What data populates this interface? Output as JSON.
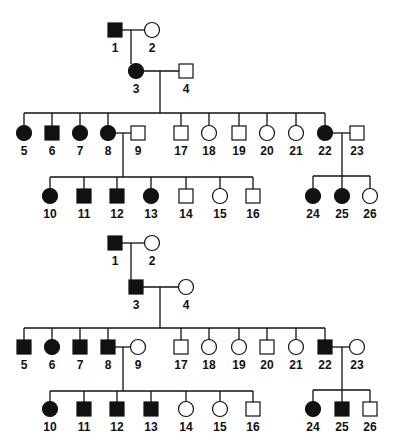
{
  "pedigrees": [
    {
      "name": "pedigree-top",
      "individuals": [
        {
          "id": "1",
          "sex": "male",
          "affected": true,
          "x": 115,
          "y": 30
        },
        {
          "id": "2",
          "sex": "female",
          "affected": false,
          "x": 152,
          "y": 30
        },
        {
          "id": "3",
          "sex": "female",
          "affected": true,
          "x": 136,
          "y": 71
        },
        {
          "id": "4",
          "sex": "male",
          "affected": false,
          "x": 186,
          "y": 71
        },
        {
          "id": "5",
          "sex": "female",
          "affected": true,
          "x": 24,
          "y": 133
        },
        {
          "id": "6",
          "sex": "male",
          "affected": true,
          "x": 52,
          "y": 133
        },
        {
          "id": "7",
          "sex": "female",
          "affected": true,
          "x": 80,
          "y": 133
        },
        {
          "id": "8",
          "sex": "female",
          "affected": true,
          "x": 108,
          "y": 133
        },
        {
          "id": "9",
          "sex": "male",
          "affected": false,
          "x": 138,
          "y": 133
        },
        {
          "id": "17",
          "sex": "male",
          "affected": false,
          "x": 181,
          "y": 133
        },
        {
          "id": "18",
          "sex": "female",
          "affected": false,
          "x": 209,
          "y": 133
        },
        {
          "id": "19",
          "sex": "male",
          "affected": false,
          "x": 239,
          "y": 133
        },
        {
          "id": "20",
          "sex": "female",
          "affected": false,
          "x": 267,
          "y": 133
        },
        {
          "id": "21",
          "sex": "female",
          "affected": false,
          "x": 296,
          "y": 133
        },
        {
          "id": "22",
          "sex": "female",
          "affected": true,
          "x": 325,
          "y": 133
        },
        {
          "id": "23",
          "sex": "male",
          "affected": false,
          "x": 357,
          "y": 133
        },
        {
          "id": "10",
          "sex": "female",
          "affected": true,
          "x": 50,
          "y": 196
        },
        {
          "id": "11",
          "sex": "male",
          "affected": true,
          "x": 84,
          "y": 196
        },
        {
          "id": "12",
          "sex": "male",
          "affected": true,
          "x": 117,
          "y": 196
        },
        {
          "id": "13",
          "sex": "female",
          "affected": true,
          "x": 151,
          "y": 196
        },
        {
          "id": "14",
          "sex": "male",
          "affected": false,
          "x": 186,
          "y": 196
        },
        {
          "id": "15",
          "sex": "female",
          "affected": false,
          "x": 220,
          "y": 196
        },
        {
          "id": "16",
          "sex": "male",
          "affected": false,
          "x": 253,
          "y": 196
        },
        {
          "id": "24",
          "sex": "female",
          "affected": true,
          "x": 313,
          "y": 196
        },
        {
          "id": "25",
          "sex": "female",
          "affected": true,
          "x": 342,
          "y": 196
        },
        {
          "id": "26",
          "sex": "female",
          "affected": false,
          "x": 370,
          "y": 196
        }
      ],
      "lines": [
        [
          122,
          30,
          145,
          30
        ],
        [
          131,
          30,
          131,
          64
        ],
        [
          143,
          71,
          179,
          71
        ],
        [
          160,
          71,
          160,
          113
        ],
        [
          24,
          113,
          325,
          113
        ],
        [
          24,
          113,
          24,
          126
        ],
        [
          52,
          113,
          52,
          126
        ],
        [
          80,
          113,
          80,
          126
        ],
        [
          108,
          113,
          108,
          126
        ],
        [
          181,
          113,
          181,
          126
        ],
        [
          209,
          113,
          209,
          126
        ],
        [
          239,
          113,
          239,
          126
        ],
        [
          267,
          113,
          267,
          126
        ],
        [
          296,
          113,
          296,
          126
        ],
        [
          325,
          113,
          325,
          126
        ],
        [
          115,
          133,
          131,
          133
        ],
        [
          123,
          133,
          123,
          177
        ],
        [
          50,
          177,
          253,
          177
        ],
        [
          50,
          177,
          50,
          189
        ],
        [
          84,
          177,
          84,
          189
        ],
        [
          117,
          177,
          117,
          189
        ],
        [
          151,
          177,
          151,
          189
        ],
        [
          186,
          177,
          186,
          189
        ],
        [
          220,
          177,
          220,
          189
        ],
        [
          253,
          177,
          253,
          189
        ],
        [
          332,
          133,
          350,
          133
        ],
        [
          342,
          133,
          342,
          176
        ],
        [
          313,
          176,
          370,
          176
        ],
        [
          313,
          176,
          313,
          189
        ],
        [
          342,
          176,
          342,
          189
        ],
        [
          370,
          176,
          370,
          189
        ]
      ]
    },
    {
      "name": "pedigree-bottom",
      "individuals": [
        {
          "id": "1",
          "sex": "male",
          "affected": true,
          "x": 115,
          "y": 243
        },
        {
          "id": "2",
          "sex": "female",
          "affected": false,
          "x": 152,
          "y": 243
        },
        {
          "id": "3",
          "sex": "male",
          "affected": true,
          "x": 136,
          "y": 287
        },
        {
          "id": "4",
          "sex": "female",
          "affected": false,
          "x": 186,
          "y": 287
        },
        {
          "id": "5",
          "sex": "male",
          "affected": true,
          "x": 24,
          "y": 347
        },
        {
          "id": "6",
          "sex": "female",
          "affected": true,
          "x": 52,
          "y": 347
        },
        {
          "id": "7",
          "sex": "male",
          "affected": true,
          "x": 80,
          "y": 347
        },
        {
          "id": "8",
          "sex": "male",
          "affected": true,
          "x": 108,
          "y": 347
        },
        {
          "id": "9",
          "sex": "female",
          "affected": false,
          "x": 138,
          "y": 347
        },
        {
          "id": "17",
          "sex": "male",
          "affected": false,
          "x": 181,
          "y": 347
        },
        {
          "id": "18",
          "sex": "female",
          "affected": false,
          "x": 209,
          "y": 347
        },
        {
          "id": "19",
          "sex": "female",
          "affected": false,
          "x": 239,
          "y": 347
        },
        {
          "id": "20",
          "sex": "male",
          "affected": false,
          "x": 267,
          "y": 347
        },
        {
          "id": "21",
          "sex": "female",
          "affected": false,
          "x": 296,
          "y": 347
        },
        {
          "id": "22",
          "sex": "male",
          "affected": true,
          "x": 325,
          "y": 347
        },
        {
          "id": "23",
          "sex": "female",
          "affected": false,
          "x": 357,
          "y": 347
        },
        {
          "id": "10",
          "sex": "female",
          "affected": true,
          "x": 50,
          "y": 409
        },
        {
          "id": "11",
          "sex": "male",
          "affected": true,
          "x": 84,
          "y": 409
        },
        {
          "id": "12",
          "sex": "male",
          "affected": true,
          "x": 117,
          "y": 409
        },
        {
          "id": "13",
          "sex": "male",
          "affected": true,
          "x": 151,
          "y": 409
        },
        {
          "id": "14",
          "sex": "female",
          "affected": false,
          "x": 186,
          "y": 409
        },
        {
          "id": "15",
          "sex": "female",
          "affected": false,
          "x": 220,
          "y": 409
        },
        {
          "id": "16",
          "sex": "male",
          "affected": false,
          "x": 253,
          "y": 409
        },
        {
          "id": "24",
          "sex": "female",
          "affected": true,
          "x": 313,
          "y": 409
        },
        {
          "id": "25",
          "sex": "male",
          "affected": true,
          "x": 342,
          "y": 409
        },
        {
          "id": "26",
          "sex": "male",
          "affected": false,
          "x": 370,
          "y": 409
        }
      ],
      "lines": [
        [
          122,
          243,
          145,
          243
        ],
        [
          131,
          243,
          131,
          280
        ],
        [
          143,
          287,
          179,
          287
        ],
        [
          160,
          287,
          160,
          328
        ],
        [
          24,
          328,
          325,
          328
        ],
        [
          24,
          328,
          24,
          340
        ],
        [
          52,
          328,
          52,
          340
        ],
        [
          80,
          328,
          80,
          340
        ],
        [
          108,
          328,
          108,
          340
        ],
        [
          181,
          328,
          181,
          340
        ],
        [
          209,
          328,
          209,
          340
        ],
        [
          239,
          328,
          239,
          340
        ],
        [
          267,
          328,
          267,
          340
        ],
        [
          296,
          328,
          296,
          340
        ],
        [
          325,
          328,
          325,
          340
        ],
        [
          115,
          347,
          131,
          347
        ],
        [
          123,
          347,
          123,
          391
        ],
        [
          50,
          391,
          253,
          391
        ],
        [
          50,
          391,
          50,
          402
        ],
        [
          84,
          391,
          84,
          402
        ],
        [
          117,
          391,
          117,
          402
        ],
        [
          151,
          391,
          151,
          402
        ],
        [
          186,
          391,
          186,
          402
        ],
        [
          220,
          391,
          220,
          402
        ],
        [
          253,
          391,
          253,
          402
        ],
        [
          332,
          347,
          350,
          347
        ],
        [
          342,
          347,
          342,
          390
        ],
        [
          313,
          390,
          370,
          390
        ],
        [
          313,
          390,
          313,
          402
        ],
        [
          342,
          390,
          342,
          402
        ],
        [
          370,
          390,
          370,
          402
        ]
      ]
    }
  ],
  "style": {
    "stroke": "#111111",
    "fill_affected": "#111111",
    "fill_unaffected": "#ffffff"
  }
}
